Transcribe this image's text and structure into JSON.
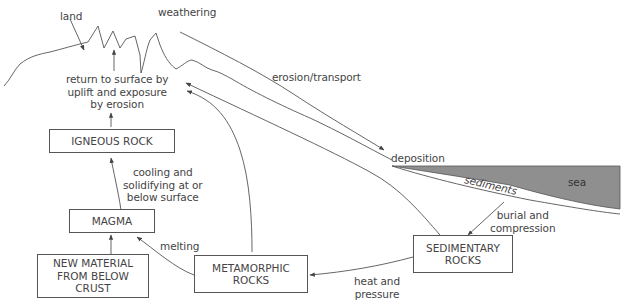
{
  "colors": {
    "line": "#555555",
    "sea_fill": "#8f8f8f",
    "text": "#444444"
  },
  "landscape_labels": {
    "land": "land",
    "weathering": "weathering",
    "erosion_transport": "erosion/transport",
    "deposition": "deposition",
    "sediments": "sediments",
    "sea": "sea"
  },
  "boxes": {
    "igneous_rock": "IGNEOUS ROCK",
    "magma": "MAGMA",
    "new_material": "NEW MATERIAL\nFROM BELOW\nCRUST",
    "metamorphic_rocks": "METAMORPHIC\nROCKS",
    "sedimentary_rocks": "SEDIMENTARY\nROCKS"
  },
  "process_labels": {
    "return_to_surface": "return to surface by\nuplift and exposure\nby erosion",
    "cooling": "cooling and\nsolidifying at or\nbelow surface",
    "melting": "melting",
    "burial": "burial and\ncompression",
    "heat_pressure": "heat and\npressure"
  }
}
